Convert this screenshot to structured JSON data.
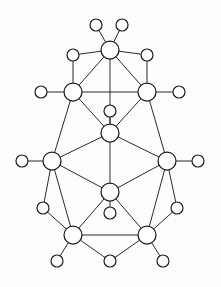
{
  "figure": {
    "title": "",
    "kind": "node-link-graph",
    "width": 221,
    "height": 287,
    "background_color": "#fdfdfc",
    "node_fill_color": "#ffffff",
    "node_stroke_color": "#1c1c1c",
    "edge_color": "#2b2b2b"
  },
  "graph": {
    "node_count": 28,
    "edge_count": 48,
    "hub_radius": 9,
    "leaf_radius": 6,
    "nodes": [
      {
        "id": "t1",
        "label": "",
        "cx": 96,
        "cy": 25,
        "r": 6,
        "role": "leaf"
      },
      {
        "id": "t2",
        "label": "",
        "cx": 122,
        "cy": 25,
        "r": 6,
        "role": "leaf"
      },
      {
        "id": "A",
        "label": "",
        "cx": 110,
        "cy": 50,
        "r": 9,
        "role": "hub"
      },
      {
        "id": "l1",
        "label": "",
        "cx": 73,
        "cy": 55,
        "r": 6,
        "role": "leaf"
      },
      {
        "id": "r1",
        "label": "",
        "cx": 147,
        "cy": 55,
        "r": 6,
        "role": "leaf"
      },
      {
        "id": "B",
        "label": "",
        "cx": 73,
        "cy": 92,
        "r": 9,
        "role": "hub"
      },
      {
        "id": "C",
        "label": "",
        "cx": 147,
        "cy": 92,
        "r": 9,
        "role": "hub"
      },
      {
        "id": "l2",
        "label": "",
        "cx": 41,
        "cy": 92,
        "r": 6,
        "role": "leaf"
      },
      {
        "id": "r2",
        "label": "",
        "cx": 179,
        "cy": 92,
        "r": 6,
        "role": "leaf"
      },
      {
        "id": "m1",
        "label": "",
        "cx": 110,
        "cy": 111,
        "r": 6,
        "role": "leaf"
      },
      {
        "id": "D",
        "label": "",
        "cx": 110,
        "cy": 133,
        "r": 9,
        "role": "hub"
      },
      {
        "id": "E",
        "label": "",
        "cx": 52,
        "cy": 161,
        "r": 9,
        "role": "hub"
      },
      {
        "id": "F",
        "label": "",
        "cx": 167,
        "cy": 161,
        "r": 9,
        "role": "hub"
      },
      {
        "id": "l3",
        "label": "",
        "cx": 22,
        "cy": 161,
        "r": 6,
        "role": "leaf"
      },
      {
        "id": "r3",
        "label": "",
        "cx": 198,
        "cy": 161,
        "r": 6,
        "role": "leaf"
      },
      {
        "id": "G",
        "label": "",
        "cx": 110,
        "cy": 192,
        "r": 9,
        "role": "hub"
      },
      {
        "id": "m2",
        "label": "",
        "cx": 110,
        "cy": 213,
        "r": 6,
        "role": "leaf"
      },
      {
        "id": "l4",
        "label": "",
        "cx": 43,
        "cy": 208,
        "r": 6,
        "role": "leaf"
      },
      {
        "id": "r4",
        "label": "",
        "cx": 177,
        "cy": 208,
        "r": 6,
        "role": "leaf"
      },
      {
        "id": "H",
        "label": "",
        "cx": 73,
        "cy": 235,
        "r": 9,
        "role": "hub"
      },
      {
        "id": "I",
        "label": "",
        "cx": 147,
        "cy": 235,
        "r": 9,
        "role": "hub"
      },
      {
        "id": "b1",
        "label": "",
        "cx": 57,
        "cy": 261,
        "r": 6,
        "role": "leaf"
      },
      {
        "id": "b2",
        "label": "",
        "cx": 110,
        "cy": 261,
        "r": 6,
        "role": "leaf"
      },
      {
        "id": "b3",
        "label": "",
        "cx": 163,
        "cy": 261,
        "r": 6,
        "role": "leaf"
      }
    ],
    "edges": [
      [
        "t1",
        "A"
      ],
      [
        "t2",
        "A"
      ],
      [
        "l1",
        "A"
      ],
      [
        "r1",
        "A"
      ],
      [
        "l1",
        "B"
      ],
      [
        "r1",
        "C"
      ],
      [
        "A",
        "B"
      ],
      [
        "A",
        "C"
      ],
      [
        "A",
        "D"
      ],
      [
        "B",
        "C"
      ],
      [
        "l2",
        "B"
      ],
      [
        "r2",
        "C"
      ],
      [
        "B",
        "D"
      ],
      [
        "C",
        "D"
      ],
      [
        "m1",
        "D"
      ],
      [
        "B",
        "E"
      ],
      [
        "C",
        "F"
      ],
      [
        "D",
        "E"
      ],
      [
        "D",
        "F"
      ],
      [
        "l3",
        "E"
      ],
      [
        "r3",
        "F"
      ],
      [
        "D",
        "G"
      ],
      [
        "E",
        "G"
      ],
      [
        "F",
        "G"
      ],
      [
        "E",
        "H"
      ],
      [
        "F",
        "I"
      ],
      [
        "l4",
        "H"
      ],
      [
        "r4",
        "I"
      ],
      [
        "E",
        "l4"
      ],
      [
        "F",
        "r4"
      ],
      [
        "G",
        "H"
      ],
      [
        "G",
        "I"
      ],
      [
        "G",
        "m2"
      ],
      [
        "H",
        "I"
      ],
      [
        "H",
        "b1"
      ],
      [
        "H",
        "b2"
      ],
      [
        "I",
        "b2"
      ],
      [
        "I",
        "b3"
      ]
    ]
  }
}
